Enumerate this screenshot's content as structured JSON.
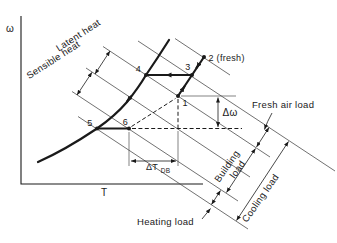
{
  "figure": {
    "axis": {
      "y_label": "ω",
      "x_label": "T"
    },
    "point_labels": {
      "p1": "1",
      "p2": "2 (fresh)",
      "p3": "3",
      "p4": "4",
      "p5": "5",
      "p6": "6"
    },
    "annotations": {
      "latent": "Latent heat",
      "sensible": "Sensible heat",
      "fresh_air": "Fresh air load",
      "building_line1": "Building",
      "building_line2": "load",
      "cooling": "Cooling load",
      "heating": "Heating load",
      "delta_omega": "Δω",
      "delta_t": "ΔT",
      "delta_t_sub": "DB"
    },
    "colors": {
      "ink": "#1a1a1a",
      "thin_line": "#4d4d4d",
      "background": "#ffffff"
    }
  }
}
